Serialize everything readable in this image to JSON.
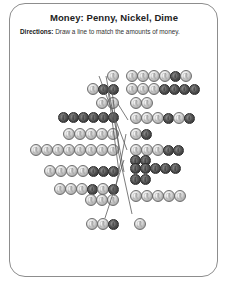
{
  "worksheet": {
    "title": "Money: Penny, Nickel, Dime",
    "directions_label": "Directions:",
    "directions_text": "Draw a line to match the amounts of money.",
    "border_color": "#8d8d8d",
    "background_color": "#ffffff",
    "line_color": "#5a5a5a"
  },
  "coin_types": {
    "penny": {
      "name": "penny",
      "shade": "dark",
      "value_cents": 1,
      "diameter_px": 11
    },
    "nickel": {
      "name": "nickel",
      "shade": "light",
      "value_cents": 5,
      "diameter_px": 12
    },
    "dime": {
      "name": "dime",
      "shade": "light",
      "value_cents": 10,
      "diameter_px": 10
    }
  },
  "left_column": [
    {
      "id": "left-group-1",
      "x": 88,
      "y": 70,
      "align": "right",
      "width": 30,
      "rows": [
        {
          "coins": [
            "nickel"
          ]
        }
      ]
    },
    {
      "id": "left-group-2",
      "x": 62,
      "y": 83,
      "align": "right",
      "width": 56,
      "rows": [
        {
          "coins": [
            "nickel",
            "penny",
            "penny"
          ]
        }
      ]
    },
    {
      "id": "left-group-3",
      "x": 80,
      "y": 97,
      "align": "right",
      "width": 38,
      "rows": [
        {
          "coins": [
            "nickel",
            "nickel"
          ]
        }
      ]
    },
    {
      "id": "left-group-4",
      "x": 36,
      "y": 112,
      "align": "right",
      "width": 82,
      "rows": [
        {
          "coins": [
            "penny",
            "penny",
            "penny",
            "penny",
            "penny",
            "penny"
          ]
        }
      ]
    },
    {
      "id": "left-group-5",
      "x": 46,
      "y": 128,
      "align": "right",
      "width": 72,
      "rows": [
        {
          "coins": [
            "nickel",
            "nickel",
            "nickel",
            "nickel",
            "nickel"
          ]
        }
      ]
    },
    {
      "id": "left-group-6",
      "x": 18,
      "y": 144,
      "align": "right",
      "width": 100,
      "rows": [
        {
          "coins": [
            "nickel",
            "nickel",
            "nickel",
            "nickel",
            "nickel",
            "nickel",
            "nickel",
            "nickel"
          ]
        }
      ]
    },
    {
      "id": "left-group-7",
      "x": 20,
      "y": 165,
      "align": "right",
      "width": 98,
      "rows": [
        {
          "coins": [
            "nickel",
            "nickel",
            "nickel",
            "nickel",
            "penny",
            "penny",
            "penny"
          ]
        }
      ]
    },
    {
      "id": "left-group-8",
      "x": 22,
      "y": 183,
      "align": "right",
      "width": 96,
      "rows": [
        {
          "coins": [
            "nickel",
            "nickel",
            "nickel",
            "penny",
            "nickel",
            "penny"
          ]
        },
        {
          "coins": [
            "nickel",
            "nickel",
            "nickel"
          ]
        }
      ]
    },
    {
      "id": "left-group-9",
      "x": 78,
      "y": 218,
      "align": "right",
      "width": 40,
      "rows": [
        {
          "coins": [
            "nickel",
            "nickel",
            "penny"
          ]
        }
      ]
    }
  ],
  "right_column": [
    {
      "id": "right-group-1",
      "x": 126,
      "y": 70,
      "align": "left",
      "width": 96,
      "rows": [
        {
          "coins": [
            "nickel",
            "nickel",
            "nickel",
            "nickel",
            "penny",
            "nickel"
          ]
        }
      ]
    },
    {
      "id": "right-group-2",
      "x": 126,
      "y": 83,
      "align": "left",
      "width": 96,
      "rows": [
        {
          "coins": [
            "nickel",
            "nickel",
            "nickel",
            "penny",
            "penny",
            "penny",
            "penny"
          ]
        }
      ]
    },
    {
      "id": "right-group-3",
      "x": 130,
      "y": 97,
      "align": "left",
      "width": 40,
      "rows": [
        {
          "coins": [
            "nickel",
            "nickel"
          ]
        }
      ]
    },
    {
      "id": "right-group-4",
      "x": 130,
      "y": 112,
      "align": "left",
      "width": 92,
      "rows": [
        {
          "coins": [
            "nickel",
            "nickel",
            "nickel",
            "penny",
            "nickel",
            "penny"
          ]
        }
      ]
    },
    {
      "id": "right-group-5",
      "x": 130,
      "y": 128,
      "align": "left",
      "width": 40,
      "rows": [
        {
          "coins": [
            "nickel",
            "penny"
          ]
        }
      ]
    },
    {
      "id": "right-group-6",
      "x": 130,
      "y": 144,
      "align": "left",
      "width": 92,
      "rows": [
        {
          "coins": [
            "nickel",
            "nickel",
            "nickel",
            "penny",
            "penny"
          ]
        },
        {
          "coins": [
            "penny",
            "penny"
          ]
        }
      ]
    },
    {
      "id": "right-group-7",
      "x": 130,
      "y": 163,
      "align": "left",
      "width": 92,
      "rows": [
        {
          "coins": [
            "penny",
            "penny",
            "penny",
            "penny",
            "penny"
          ]
        },
        {
          "coins": [
            "penny",
            "penny"
          ]
        }
      ]
    },
    {
      "id": "right-group-8",
      "x": 130,
      "y": 190,
      "align": "left",
      "width": 92,
      "rows": [
        {
          "coins": [
            "nickel",
            "nickel",
            "nickel",
            "nickel",
            "nickel"
          ]
        }
      ]
    },
    {
      "id": "right-group-9",
      "x": 134,
      "y": 218,
      "align": "left",
      "width": 30,
      "rows": [
        {
          "coins": [
            "nickel"
          ]
        }
      ]
    }
  ],
  "match_lines": [
    {
      "id": "line-1",
      "x1": 99,
      "y1": 76,
      "x2": 127,
      "y2": 150
    },
    {
      "id": "line-2",
      "x1": 106,
      "y1": 76,
      "x2": 124,
      "y2": 172
    },
    {
      "id": "line-3",
      "x1": 118,
      "y1": 104,
      "x2": 128,
      "y2": 120
    },
    {
      "id": "line-4",
      "x1": 119,
      "y1": 150,
      "x2": 112,
      "y2": 90
    },
    {
      "id": "line-5",
      "x1": 119,
      "y1": 172,
      "x2": 108,
      "y2": 90
    },
    {
      "id": "line-6",
      "x1": 114,
      "y1": 196,
      "x2": 126,
      "y2": 134
    },
    {
      "id": "line-7",
      "x1": 105,
      "y1": 218,
      "x2": 124,
      "y2": 160
    },
    {
      "id": "line-8",
      "x1": 132,
      "y1": 214,
      "x2": 118,
      "y2": 150
    }
  ]
}
